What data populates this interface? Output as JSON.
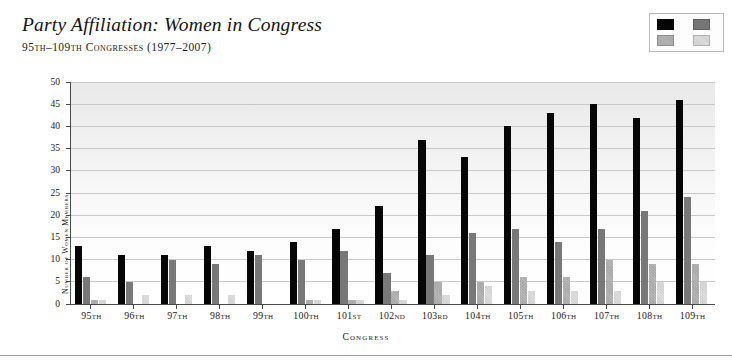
{
  "header": {
    "title": "Party Affiliation: Women in Congress",
    "subtitle": "95th–109th Congresses (1977–2007)"
  },
  "legend": {
    "items": [
      {
        "label": "House Democrats",
        "key": "house_democrats",
        "color": "#050505",
        "swatch": "sw-hd"
      },
      {
        "label": "House Republicans",
        "key": "house_republicans",
        "color": "#767676",
        "swatch": "sw-hr"
      },
      {
        "label": "Senate Democrats",
        "key": "senate_democrats",
        "color": "#b3b3b3",
        "swatch": "sw-sd"
      },
      {
        "label": "Senate Republicans",
        "key": "senate_republicans",
        "color": "#dcdcdc",
        "swatch": "sw-sr"
      }
    ]
  },
  "chart_data": {
    "type": "bar",
    "title": "Party Affiliation: Women in Congress",
    "subtitle": "95th–109th Congresses (1977–2007)",
    "xlabel": "Congress",
    "ylabel": "Number of Women Members",
    "ylim": [
      0,
      50
    ],
    "ytick_step": 5,
    "yticks": [
      0,
      5,
      10,
      15,
      20,
      25,
      30,
      35,
      40,
      45,
      50
    ],
    "grid": true,
    "legend_position": "top-right",
    "categories": [
      "95th",
      "96th",
      "97th",
      "98th",
      "99th",
      "100th",
      "101st",
      "102nd",
      "103rd",
      "104th",
      "105th",
      "106th",
      "107th",
      "108th",
      "109th"
    ],
    "series": [
      {
        "name": "House Democrats",
        "color": "#050505",
        "values": [
          13,
          11,
          11,
          13,
          12,
          14,
          17,
          22,
          37,
          33,
          40,
          43,
          45,
          42,
          46
        ]
      },
      {
        "name": "House Republicans",
        "color": "#767676",
        "values": [
          6,
          5,
          10,
          9,
          11,
          10,
          12,
          7,
          11,
          16,
          17,
          14,
          17,
          21,
          24
        ]
      },
      {
        "name": "Senate Democrats",
        "color": "#b3b3b3",
        "values": [
          1,
          0,
          0,
          0,
          0,
          1,
          1,
          3,
          5,
          5,
          6,
          6,
          10,
          9,
          9
        ]
      },
      {
        "name": "Senate Republicans",
        "color": "#dcdcdc",
        "values": [
          1,
          2,
          2,
          2,
          0,
          1,
          1,
          1,
          2,
          4,
          3,
          3,
          3,
          5,
          5
        ]
      }
    ]
  }
}
